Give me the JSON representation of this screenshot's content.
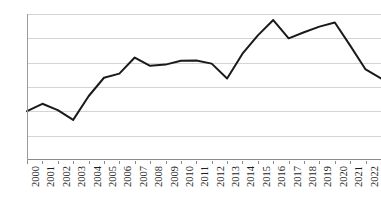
{
  "chart_data": {
    "type": "line",
    "title": "",
    "subtitle": "",
    "xlabel": "",
    "ylabel": "",
    "legend": [],
    "legend_position": "none",
    "grid": true,
    "xlim": [
      2000,
      2023
    ],
    "ylim": [
      0,
      0.6
    ],
    "y_ticks": [
      0,
      0.1,
      0.2,
      0.3,
      0.4,
      0.5,
      0.6
    ],
    "y_tick_labels": [
      "0",
      "0.1",
      "0.2",
      "0.3",
      "0.4",
      "0.5",
      "0.6"
    ],
    "categories": [
      "2000",
      "2001",
      "2002",
      "2003",
      "2004",
      "2005",
      "2006",
      "2007",
      "2008",
      "2009",
      "2010",
      "2011",
      "2012",
      "2013",
      "2014",
      "2015",
      "2016",
      "2017",
      "2018",
      "2019",
      "2020",
      "2021",
      "2022",
      "2023"
    ],
    "values": [
      0.201,
      0.231,
      0.205,
      0.165,
      0.262,
      0.338,
      0.355,
      0.421,
      0.387,
      0.392,
      0.408,
      0.409,
      0.396,
      0.335,
      0.437,
      0.512,
      0.575,
      0.5,
      0.525,
      0.548,
      0.565,
      0.47,
      0.372,
      0.335
    ],
    "series_color": "#1a1a1a",
    "grid_color": "#d4d4d4",
    "axis_color": "#8a8a8a"
  }
}
